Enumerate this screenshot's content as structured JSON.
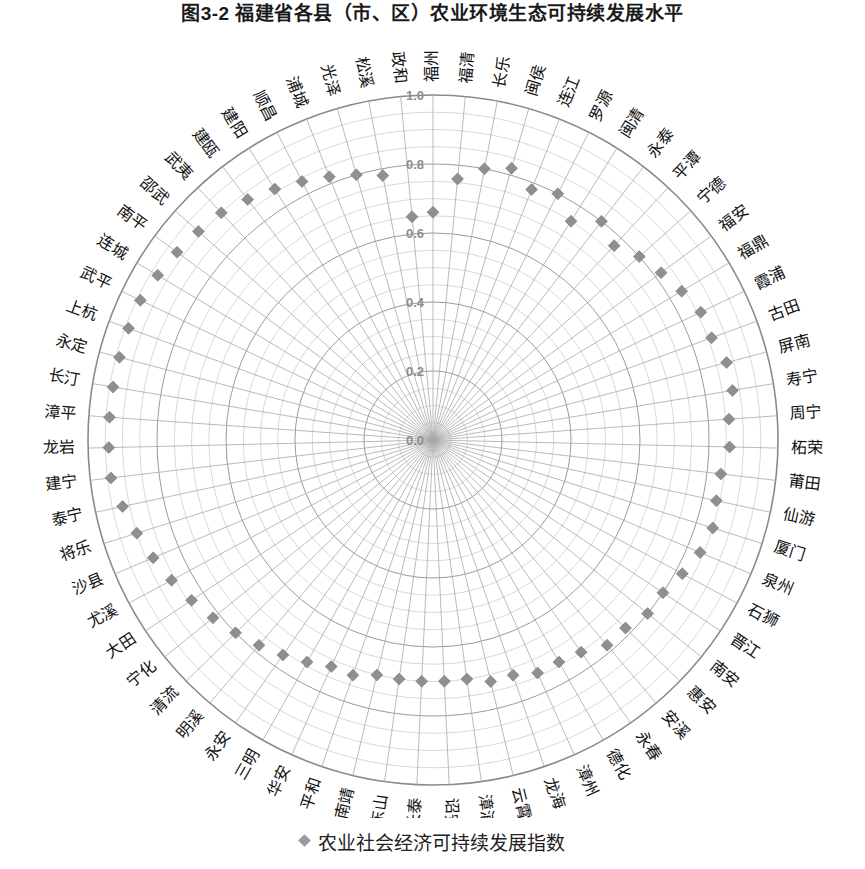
{
  "title": "图3-2  福建省各县（市、区）农业环境生态可持续发展水平",
  "legend": {
    "marker": "diamond-marker",
    "label": "农业社会经济可持续发展指数"
  },
  "axis": {
    "tick_labels": [
      "0.0",
      "0.2",
      "0.4",
      "0.6",
      "0.8",
      "1.0"
    ],
    "tick_values": [
      0.0,
      0.2,
      0.4,
      0.6,
      0.8,
      1.0
    ]
  },
  "colors": {
    "marker": "#8f8f8f",
    "grid": "#9b9b9b",
    "outer_ring": "#8a8a8a",
    "tick_text": "#8d8d8d",
    "label_text": "#111111"
  },
  "chart_data": {
    "type": "scatter",
    "projection": "polar",
    "title": "图3-2  福建省各县（市、区）农业环境生态可持续发展水平",
    "xlabel": "",
    "ylabel": "",
    "ylim": [
      0.0,
      1.0
    ],
    "grid": true,
    "legend_position": "bottom",
    "start_angle_deg": 90,
    "direction": "clockwise",
    "categories": [
      "福州",
      "福清",
      "长乐",
      "闽侯",
      "连江",
      "罗源",
      "闽清",
      "永泰",
      "平潭",
      "宁德",
      "福安",
      "福鼎",
      "霞浦",
      "古田",
      "屏南",
      "寿宁",
      "周宁",
      "柘荣",
      "莆田",
      "仙游",
      "厦门",
      "泉州",
      "石狮",
      "晋江",
      "南安",
      "惠安",
      "安溪",
      "永春",
      "德化",
      "漳州",
      "龙海",
      "云霄",
      "漳浦",
      "诏安",
      "长泰",
      "东山",
      "南靖",
      "平和",
      "华安",
      "三明",
      "永安",
      "明溪",
      "清流",
      "宁化",
      "大田",
      "尤溪",
      "沙县",
      "将乐",
      "泰宁",
      "建宁",
      "龙岩",
      "漳平",
      "长汀",
      "永定",
      "上杭",
      "武平",
      "连城",
      "南平",
      "邵武",
      "武夷",
      "建瓯",
      "建阳",
      "顺昌",
      "浦城",
      "光泽",
      "松溪",
      "政和"
    ],
    "series": [
      {
        "name": "农业社会经济可持续发展指数",
        "values": [
          0.66,
          0.76,
          0.8,
          0.82,
          0.78,
          0.8,
          0.75,
          0.8,
          0.77,
          0.8,
          0.82,
          0.84,
          0.86,
          0.86,
          0.88,
          0.88,
          0.86,
          0.86,
          0.84,
          0.84,
          0.85,
          0.84,
          0.82,
          0.8,
          0.8,
          0.78,
          0.78,
          0.75,
          0.74,
          0.74,
          0.72,
          0.72,
          0.7,
          0.7,
          0.7,
          0.7,
          0.7,
          0.72,
          0.72,
          0.74,
          0.76,
          0.78,
          0.8,
          0.82,
          0.84,
          0.86,
          0.88,
          0.9,
          0.92,
          0.94,
          0.94,
          0.94,
          0.94,
          0.94,
          0.94,
          0.94,
          0.93,
          0.92,
          0.91,
          0.9,
          0.88,
          0.86,
          0.84,
          0.82,
          0.8,
          0.78,
          0.65
        ]
      }
    ]
  }
}
